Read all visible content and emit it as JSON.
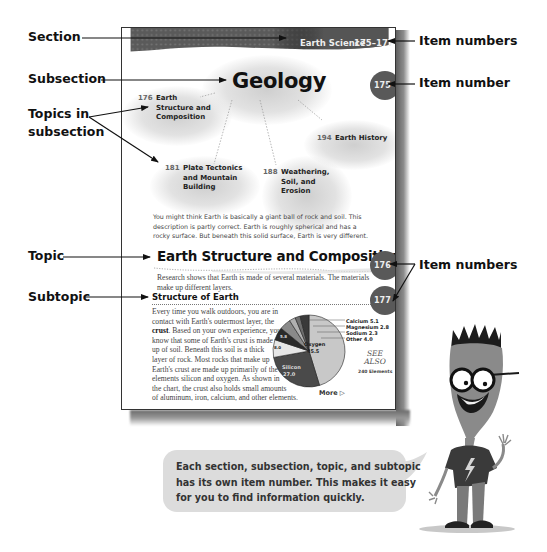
{
  "callouts": {
    "section": "Section",
    "subsection": "Subsection",
    "topics_line1": "Topics in",
    "topics_line2": "subsection",
    "topic": "Topic",
    "subtopic": "Subtopic",
    "item_numbers_top": "Item numbers",
    "item_number": "Item number",
    "item_numbers_mid": "Item numbers"
  },
  "page": {
    "header": {
      "section_name": "Earth Science",
      "item_range": "175–177"
    },
    "subsection": {
      "title": "Geology",
      "item_number": "175"
    },
    "topics": [
      {
        "number": "176",
        "lines": [
          "Earth",
          "Structure and",
          "Composition"
        ]
      },
      {
        "number": "181",
        "lines": [
          "Plate Tectonics",
          "and Mountain",
          "Building"
        ]
      },
      {
        "number": "188",
        "lines": [
          "Weathering,",
          "Soil, and",
          "Erosion"
        ]
      },
      {
        "number": "194",
        "lines": [
          "Earth History"
        ]
      }
    ],
    "intro_lines": [
      "You might think Earth is basically a giant ball of rock and soil. This",
      "description is partly correct. Earth is roughly spherical and has a",
      "rocky surface. But beneath this solid surface, Earth is very different."
    ],
    "topic": {
      "title": "Earth Structure and Composition",
      "item_number": "176",
      "intro_lines": [
        "Research shows that Earth is made of several materials. The materials",
        "make up different layers."
      ]
    },
    "subtopic": {
      "title": "Structure of Earth",
      "item_number": "177",
      "body_lines": [
        "Every time you walk outdoors, you are in",
        "contact with Earth's outermost layer, the",
        "__CRUST__ Based on your own experience, you",
        "know that some of Earth's crust is made",
        "up of soil. Beneath this soil is a thick",
        "layer of rock. Most rocks that make up",
        "Earth's crust are made up primarily of the",
        "elements silicon and oxygen. As shown in",
        "the chart, the crust also holds small amounts",
        "of aluminum, iron, calcium, and other elements."
      ],
      "bold_word": "crust",
      "line3_rest": ". Based on your own experience, you"
    },
    "see_also": {
      "line1": "SEE",
      "line2": "ALSO",
      "ref": "240 Elements"
    },
    "more_label": "More ▷"
  },
  "chart_data": {
    "type": "pie",
    "title": "",
    "labels": [
      "Oxygen",
      "Silicon",
      "Aluminum",
      "Iron",
      "Calcium",
      "Magnesium",
      "Sodium",
      "Other"
    ],
    "values": [
      45.5,
      27.0,
      8.0,
      5.8,
      5.1,
      2.8,
      2.3,
      4.0
    ],
    "colors": [
      "#c8c8c8",
      "#4a4a4a",
      "#e6e6e6",
      "#2a2a2a",
      "#8a8a8a",
      "#b0b0b0",
      "#6e6e6e",
      "#3a3a3a"
    ],
    "inside_labels": {
      "Oxygen": "45.5",
      "Silicon": "27.0",
      "Aluminum": "8.0",
      "Iron": "5.8"
    },
    "outside_labels": [
      "Calcium 5.1",
      "Magnesium 2.8",
      "Sodium 2.3",
      "Other 4.0"
    ]
  },
  "bubble": {
    "lines": [
      "Each section, subsection, topic, and subtopic",
      "has its own item number. This makes it easy",
      "for you to find information quickly."
    ]
  }
}
